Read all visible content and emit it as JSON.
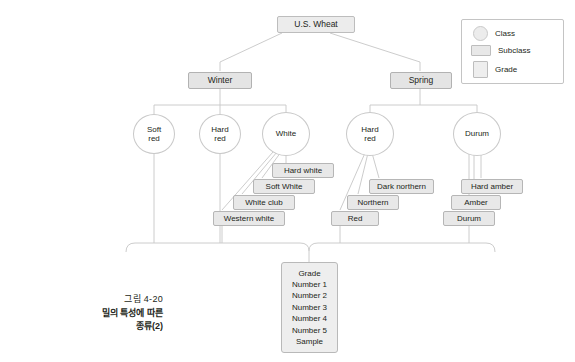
{
  "figure": {
    "root": {
      "label": "U.S. Wheat"
    },
    "branches": [
      {
        "label": "Winter"
      },
      {
        "label": "Spring"
      }
    ],
    "classes": [
      {
        "label_line1": "Soft",
        "label_line2": "red"
      },
      {
        "label_line1": "Hard",
        "label_line2": "red"
      },
      {
        "label_line1": "White",
        "label_line2": ""
      },
      {
        "label_line1": "Hard",
        "label_line2": "red"
      },
      {
        "label_line1": "Durum",
        "label_line2": ""
      }
    ],
    "subclasses_white": [
      {
        "label": "Hard white"
      },
      {
        "label": "Soft White"
      },
      {
        "label": "White club"
      },
      {
        "label": "Western white"
      }
    ],
    "subclasses_hard_red_spring": [
      {
        "label": "Dark northern"
      },
      {
        "label": "Northern"
      },
      {
        "label": "Red"
      }
    ],
    "subclasses_durum": [
      {
        "label": "Hard amber"
      },
      {
        "label": "Amber"
      },
      {
        "label": "Durum"
      }
    ],
    "grades": [
      "Grade",
      "Number 1",
      "Number 2",
      "Number 3",
      "Number 4",
      "Number 5",
      "Sample"
    ]
  },
  "legend": {
    "items": [
      {
        "label": "Class",
        "shape": "circle-swatch-icon"
      },
      {
        "label": "Subclass",
        "shape": "wide-rectangle-swatch-icon"
      },
      {
        "label": "Grade",
        "shape": "tall-rectangle-swatch-icon"
      }
    ]
  },
  "caption": {
    "number": "그림 4-20",
    "title_line1": "밀의 특성에 따른",
    "title_line2": "종류(2)"
  },
  "colors": {
    "line": "#c3c3c3",
    "box_fill": "#e8e8e8",
    "box_border": "#b6b6b6",
    "text": "#231f20",
    "page_background": "#ffffff"
  }
}
